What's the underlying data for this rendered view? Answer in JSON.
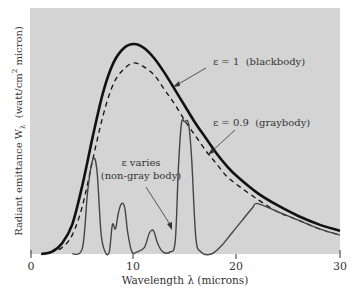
{
  "chart_data": {
    "type": "line",
    "title": "",
    "xlabel": "Wavelength λ (microns)",
    "ylabel": "Radiant emittance Wλ (watt/cm² micron)",
    "ylabel_parts": {
      "main": "Radiant emittance W",
      "sub": "λ",
      "units_pre": "(watt/cm",
      "sup": "2",
      "units_post": " micron)"
    },
    "xlim": [
      0,
      30
    ],
    "ylim": [
      0,
      110
    ],
    "x_ticks": [
      0,
      10,
      20,
      30
    ],
    "x_tick_labels": [
      "0",
      "10",
      "20",
      "30"
    ],
    "y_ticks": [],
    "grid": false,
    "legend": "none (curves labeled by annotations)",
    "series": [
      {
        "name": "ε = 1 (blackbody)",
        "style": "solid-thick",
        "x": [
          1,
          2,
          3,
          4,
          5,
          6,
          7,
          8,
          9,
          10,
          11,
          12,
          13,
          14,
          15,
          16,
          17,
          18,
          19,
          20,
          22,
          24,
          26,
          28,
          30
        ],
        "y": [
          0,
          1,
          5,
          14,
          33,
          56,
          77,
          91,
          98,
          100,
          98,
          93,
          86,
          78,
          70,
          62,
          55,
          48,
          42,
          37,
          29,
          23,
          18,
          14,
          11
        ]
      },
      {
        "name": "ε = 0.9 (graybody)",
        "style": "dashed",
        "x": [
          1,
          2,
          3,
          4,
          5,
          6,
          7,
          8,
          9,
          10,
          11,
          12,
          13,
          14,
          15,
          16,
          17,
          18,
          19,
          20,
          22,
          24,
          26,
          28,
          30
        ],
        "y": [
          0,
          1,
          3,
          9,
          23,
          45,
          66,
          81,
          88,
          91,
          89,
          85,
          78,
          71,
          63,
          56,
          49,
          43,
          37,
          33,
          26,
          20,
          16,
          12,
          9
        ]
      },
      {
        "name": "ε varies (non-gray body)",
        "style": "solid-thin",
        "x": [
          4,
          5,
          5.5,
          6,
          6.4,
          6.8,
          7.2,
          7.6,
          7.9,
          8.2,
          8.5,
          8.8,
          9.1,
          9.4,
          9.8,
          10.3,
          11,
          11.5,
          11.9,
          12.3,
          12.8,
          13.5,
          14,
          14.3,
          14.6,
          14.9,
          15.3,
          15.6,
          16,
          16.5,
          17.5,
          18.5,
          19.5,
          20.5,
          21.5,
          22,
          24,
          26,
          28,
          30
        ],
        "y": [
          0,
          3,
          30,
          45,
          40,
          10,
          1,
          1,
          14,
          12,
          20,
          24,
          22,
          10,
          1,
          1,
          3,
          10,
          11,
          5,
          1,
          1,
          6,
          40,
          62,
          63,
          62,
          45,
          8,
          1,
          0,
          4,
          10,
          16,
          22,
          24,
          20,
          16,
          12,
          9
        ]
      }
    ],
    "annotations": [
      {
        "text": "ε = 1 (blackbody)",
        "points_to": "blackbody curve near λ≈16"
      },
      {
        "text": "ε = 0.9 (graybody)",
        "points_to": "graybody curve near λ≈19"
      },
      {
        "text": "ε varies",
        "text2": "(non-gray body)",
        "points_to": "non-gray curve near λ≈14"
      }
    ]
  },
  "labels": {
    "blackbody": "ε = 1  (blackbody)",
    "graybody": "ε = 0.9  (graybody)",
    "nongray_line1": "ε varies",
    "nongray_line2": "(non-gray body)",
    "xlabel": "Wavelength λ (microns)",
    "ylabel_main": "Radiant emittance W",
    "ylabel_sub": "λ",
    "ylabel_units_pre": "  (watt/cm",
    "ylabel_sup": "2",
    "ylabel_units_post": " micron)",
    "tick0": "0",
    "tick10": "10",
    "tick20": "20",
    "tick30": "30"
  },
  "colors": {
    "plot_bg": "#d4d4d4",
    "curve": "#111111",
    "nongray": "#444444",
    "text": "#333333"
  }
}
